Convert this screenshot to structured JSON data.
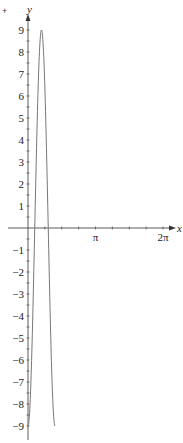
{
  "chart_data": {
    "type": "line",
    "title": "",
    "xlabel": "x",
    "ylabel": "y",
    "function": "y = -9 cos(5x)",
    "x_range": [
      0,
      1.2566
    ],
    "xlim": [
      -0.4,
      6.6
    ],
    "ylim": [
      -9.2,
      9.4
    ],
    "x_ticks": [
      {
        "value": 1.5708,
        "label": ""
      },
      {
        "value": 3.1416,
        "label": "π"
      },
      {
        "value": 4.7124,
        "label": ""
      },
      {
        "value": 6.2832,
        "label": "2π"
      }
    ],
    "y_ticks": [
      {
        "value": 9,
        "label": "9"
      },
      {
        "value": 8,
        "label": "8"
      },
      {
        "value": 7,
        "label": "7"
      },
      {
        "value": 6,
        "label": "6"
      },
      {
        "value": 5,
        "label": "5"
      },
      {
        "value": 4,
        "label": "4"
      },
      {
        "value": 3,
        "label": "3"
      },
      {
        "value": 2,
        "label": "2"
      },
      {
        "value": 1,
        "label": "1"
      },
      {
        "value": -1,
        "label": "−1"
      },
      {
        "value": -2,
        "label": "−2"
      },
      {
        "value": -3,
        "label": "−3"
      },
      {
        "value": -4,
        "label": "−4"
      },
      {
        "value": -5,
        "label": "−5"
      },
      {
        "value": -6,
        "label": "−6"
      },
      {
        "value": -7,
        "label": "−7"
      },
      {
        "value": -8,
        "label": "−8"
      },
      {
        "value": -9,
        "label": "−9"
      }
    ],
    "minor_y_step": 0.5,
    "series": [
      {
        "name": "curve",
        "color": "#777777",
        "x": [
          0,
          0.1,
          0.2,
          0.3,
          0.4,
          0.5,
          0.6,
          0.628,
          0.7,
          0.8,
          0.9,
          1.0,
          1.1,
          1.2,
          1.2566
        ],
        "y": [
          -9,
          -7.9,
          -4.86,
          -0.64,
          3.75,
          7.21,
          8.91,
          9,
          8.43,
          5.93,
          1.91,
          -2.55,
          -6.38,
          -8.64,
          -9
        ]
      }
    ],
    "grid": false,
    "legend": null
  },
  "labels": {
    "x_axis": "x",
    "y_axis": "y",
    "stray_mark": "+"
  },
  "colors": {
    "axis": "#333333",
    "curve": "#777777"
  }
}
